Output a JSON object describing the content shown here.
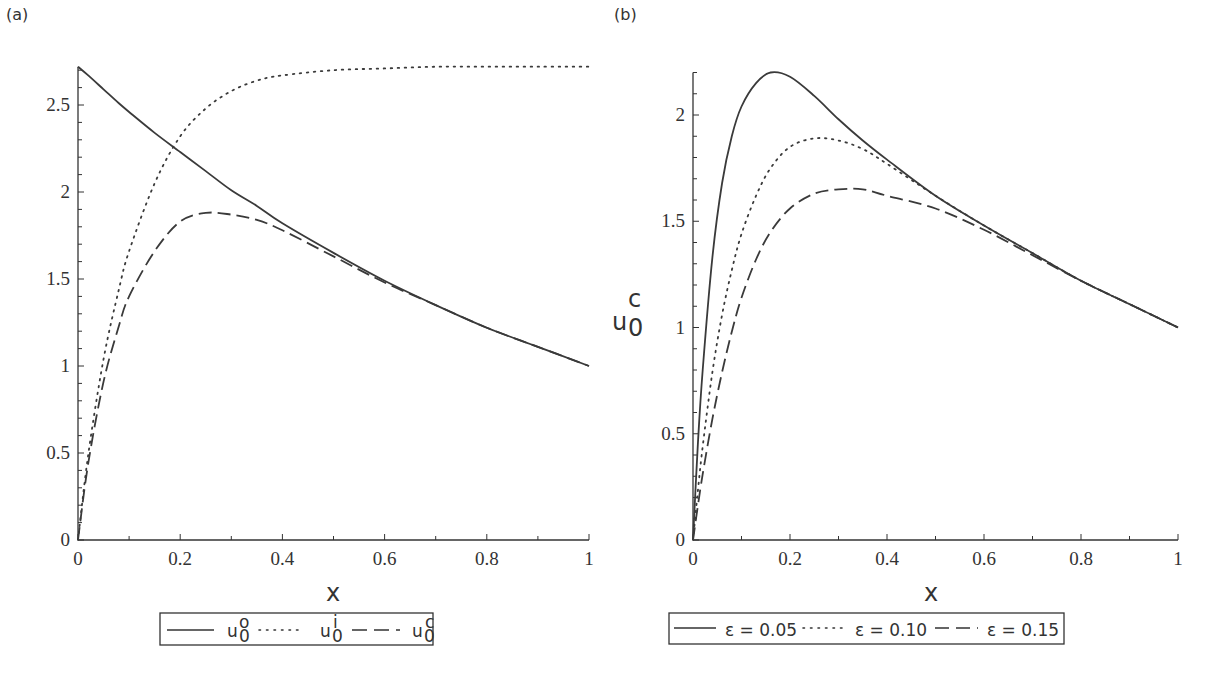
{
  "chart_data": [
    {
      "type": "line",
      "panel_label": "(a)",
      "title": "",
      "xlabel": "x",
      "ylabel": "",
      "xlim": [
        0,
        1
      ],
      "ylim": [
        0,
        2.72
      ],
      "xticks": [
        "0",
        "0.2",
        "0.4",
        "0.6",
        "0.8",
        "1"
      ],
      "yticks": [
        "0",
        "0.5",
        "1",
        "1.5",
        "2",
        "2.5"
      ],
      "grid": false,
      "legend_position": "bottom",
      "x": [
        0,
        0.02,
        0.05,
        0.08,
        0.1,
        0.15,
        0.2,
        0.25,
        0.3,
        0.35,
        0.4,
        0.5,
        0.6,
        0.7,
        0.8,
        0.9,
        1.0
      ],
      "series": [
        {
          "name": "u_0^o",
          "legend": "u0o",
          "style": "solid",
          "values": [
            2.72,
            2.67,
            2.59,
            2.51,
            2.46,
            2.34,
            2.23,
            2.12,
            2.01,
            1.92,
            1.82,
            1.65,
            1.49,
            1.35,
            1.22,
            1.11,
            1.0
          ]
        },
        {
          "name": "u_0^i",
          "legend": "u0i",
          "style": "dotted",
          "values": [
            0.0,
            0.49,
            1.04,
            1.44,
            1.66,
            2.05,
            2.32,
            2.48,
            2.58,
            2.64,
            2.67,
            2.7,
            2.71,
            2.72,
            2.72,
            2.72,
            2.72
          ]
        },
        {
          "name": "u_0^c",
          "legend": "u0c",
          "style": "dashed",
          "values": [
            0.0,
            0.44,
            0.91,
            1.23,
            1.4,
            1.66,
            1.83,
            1.88,
            1.87,
            1.84,
            1.78,
            1.63,
            1.48,
            1.35,
            1.22,
            1.11,
            1.0
          ]
        }
      ]
    },
    {
      "type": "line",
      "panel_label": "(b)",
      "title": "",
      "xlabel": "x",
      "ylabel": "u0c",
      "xlim": [
        0,
        1
      ],
      "ylim": [
        0,
        2.2
      ],
      "xticks": [
        "0",
        "0.2",
        "0.4",
        "0.6",
        "0.8",
        "1"
      ],
      "yticks": [
        "0",
        "0.5",
        "1",
        "1.5",
        "2"
      ],
      "grid": false,
      "legend_position": "bottom",
      "x": [
        0,
        0.01,
        0.02,
        0.04,
        0.06,
        0.08,
        0.1,
        0.13,
        0.16,
        0.2,
        0.25,
        0.3,
        0.35,
        0.4,
        0.5,
        0.6,
        0.7,
        0.8,
        0.9,
        1.0
      ],
      "series": [
        {
          "name": "ε=0.05",
          "style": "solid",
          "values": [
            0.0,
            0.45,
            0.8,
            1.33,
            1.68,
            1.9,
            2.04,
            2.15,
            2.2,
            2.18,
            2.09,
            1.98,
            1.88,
            1.79,
            1.62,
            1.48,
            1.35,
            1.22,
            1.11,
            1.0
          ]
        },
        {
          "name": "ε=0.10",
          "style": "dotted",
          "values": [
            0.0,
            0.23,
            0.44,
            0.79,
            1.06,
            1.27,
            1.44,
            1.62,
            1.75,
            1.85,
            1.89,
            1.88,
            1.84,
            1.77,
            1.62,
            1.48,
            1.35,
            1.22,
            1.11,
            1.0
          ]
        },
        {
          "name": "ε=0.15",
          "style": "dashed",
          "values": [
            0.0,
            0.16,
            0.31,
            0.57,
            0.79,
            0.98,
            1.14,
            1.32,
            1.45,
            1.56,
            1.63,
            1.65,
            1.65,
            1.62,
            1.56,
            1.46,
            1.34,
            1.22,
            1.11,
            1.0
          ]
        }
      ]
    }
  ],
  "panels": {
    "a": {
      "label": "(a)",
      "xlabel": "x",
      "legend": [
        {
          "base": "u",
          "sub": "0",
          "sup": "o"
        },
        {
          "base": "u",
          "sub": "0",
          "sup": "i"
        },
        {
          "base": "u",
          "sub": "0",
          "sup": "c"
        }
      ]
    },
    "b": {
      "label": "(b)",
      "xlabel": "x",
      "ylabel": {
        "base": "u",
        "sub": "0",
        "sup": "c"
      },
      "legend": [
        "ε = 0.05",
        "ε = 0.10",
        "ε = 0.15"
      ]
    }
  }
}
